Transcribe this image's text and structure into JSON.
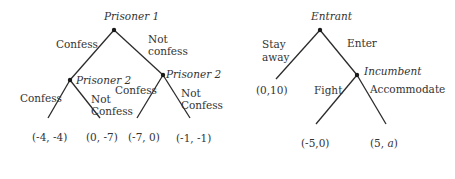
{
  "trees": [
    {
      "name": "prisoners-dilemma",
      "root": {
        "player": "Prisoner 1"
      },
      "moves_root": {
        "left": "Confess",
        "right_line1": "Not",
        "right_line2": "confess"
      },
      "subnodes": [
        {
          "player": "Prisoner 2",
          "moves": {
            "left": "Confess",
            "right_line1": "Not",
            "right_line2": "Confess"
          },
          "payoffs": [
            "(-4, -4)",
            "(0, -7)"
          ]
        },
        {
          "player": "Prisoner 2",
          "moves": {
            "left": "Confess",
            "right_line1": "Not",
            "right_line2": "Confess"
          },
          "payoffs": [
            "(-7, 0)",
            "(-1, -1)"
          ]
        }
      ]
    },
    {
      "name": "entry-game",
      "root": {
        "player": "Entrant"
      },
      "moves_root": {
        "left_line1": "Stay",
        "left_line2": "away",
        "right": "Enter"
      },
      "stay_payoff": "(0,10)",
      "subnode": {
        "player": "Incumbent",
        "moves": {
          "left": "Fight",
          "right": "Accommodate"
        },
        "payoffs": [
          "(-5,0)"
        ],
        "accommodate_prefix": "(5, ",
        "accommodate_var": "a",
        "accommodate_suffix": ")"
      }
    }
  ],
  "colors": {
    "line": "#2b2b2b",
    "node": "#1a1a1a",
    "text": "#333333"
  }
}
